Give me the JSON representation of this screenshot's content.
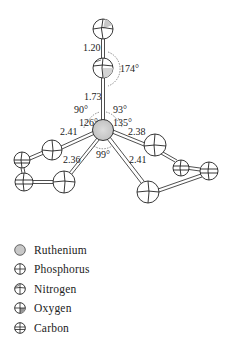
{
  "diagram": {
    "type": "molecular-structure",
    "atoms": [
      {
        "id": "O",
        "element": "Oxygen",
        "cx": 103,
        "cy": 29,
        "r": 10
      },
      {
        "id": "N",
        "element": "Nitrogen",
        "cx": 103,
        "cy": 68,
        "r": 10
      },
      {
        "id": "Ru",
        "element": "Ruthenium",
        "cx": 103,
        "cy": 130,
        "r": 10
      },
      {
        "id": "P1",
        "element": "Phosphorus",
        "cx": 52,
        "cy": 150,
        "r": 10
      },
      {
        "id": "C1",
        "element": "Carbon",
        "cx": 22,
        "cy": 160,
        "r": 8
      },
      {
        "id": "C2",
        "element": "Carbon",
        "cx": 24,
        "cy": 182,
        "r": 9
      },
      {
        "id": "P2",
        "element": "Phosphorus",
        "cx": 64,
        "cy": 182,
        "r": 11
      },
      {
        "id": "P3",
        "element": "Phosphorus",
        "cx": 155,
        "cy": 145,
        "r": 11
      },
      {
        "id": "C3",
        "element": "Carbon",
        "cx": 181,
        "cy": 168,
        "r": 8
      },
      {
        "id": "C4",
        "element": "Carbon",
        "cx": 209,
        "cy": 171,
        "r": 9
      },
      {
        "id": "P4",
        "element": "Phosphorus",
        "cx": 148,
        "cy": 192,
        "r": 11
      }
    ],
    "bond_labels": {
      "o_n": "1.20",
      "n_ru": "1.73",
      "ru_p_upper_left": "2.41",
      "ru_p_lower_left": "2.36",
      "ru_p_upper_right": "2.38",
      "ru_p_lower_right": "2.41"
    },
    "angle_labels": {
      "o_n_ru": "174°",
      "n_ru_p_left": "90°",
      "n_ru_p_right": "93°",
      "p_ru_p_left": "126°",
      "p_ru_p_right": "135°",
      "p_ru_p_lower": "99°"
    }
  },
  "legend": {
    "items": [
      {
        "label": "Ruthenium",
        "symbol": "ruthenium"
      },
      {
        "label": "Phosphorus",
        "symbol": "phosphorus"
      },
      {
        "label": "Nitrogen",
        "symbol": "nitrogen"
      },
      {
        "label": "Oxygen",
        "symbol": "oxygen"
      },
      {
        "label": "Carbon",
        "symbol": "carbon"
      }
    ]
  },
  "colors": {
    "stroke": "#222222",
    "ruthenium_fill": "#c8c8c8",
    "shade_fill": "#d0d0d0"
  }
}
